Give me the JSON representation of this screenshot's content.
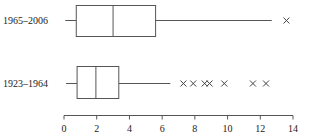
{
  "chart_data": {
    "type": "box",
    "orientation": "horizontal",
    "title": "",
    "xlabel": "",
    "ylabel": "",
    "xlim": [
      0,
      14
    ],
    "xticks": [
      0,
      2,
      4,
      6,
      8,
      10,
      12,
      14
    ],
    "grid": false,
    "legend": null,
    "series": [
      {
        "name": "1965–2006",
        "whisker_low": 0.75,
        "q1": 0.75,
        "median": 3.0,
        "q3": 5.6,
        "whisker_high": 12.7,
        "outliers": [
          13.6
        ]
      },
      {
        "name": "1923–1964",
        "whisker_low": 0.8,
        "q1": 0.8,
        "median": 1.95,
        "q3": 3.35,
        "whisker_high": 6.5,
        "outliers": [
          7.3,
          7.9,
          8.6,
          8.9,
          9.8,
          11.55,
          12.35
        ]
      }
    ]
  },
  "labels": {
    "row1": "1965–2006",
    "row2": "1923–1964"
  },
  "colors": {
    "line": "#555555",
    "text": "#222222",
    "background": "#ffffff"
  }
}
